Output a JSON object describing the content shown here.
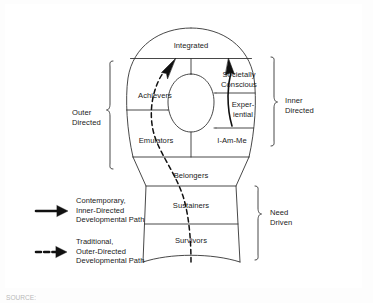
{
  "diagram": {
    "segments": [
      {
        "id": "integrated",
        "label": "Integrated"
      },
      {
        "id": "achievers",
        "label": "Achievers"
      },
      {
        "id": "societally-conscious",
        "label_line1": "Societally",
        "label_line2": "Conscious"
      },
      {
        "id": "experiential",
        "label_line1": "Exper-",
        "label_line2": "iential"
      },
      {
        "id": "emulators",
        "label": "Emulators"
      },
      {
        "id": "i-am-me",
        "label": "I-Am-Me"
      },
      {
        "id": "belongers",
        "label": "Belongers"
      },
      {
        "id": "sustainers",
        "label": "Sustainers"
      },
      {
        "id": "survivors",
        "label": "Survivors"
      }
    ],
    "groups": [
      {
        "id": "outer-directed",
        "line1": "Outer",
        "line2": "Directed",
        "side": "left"
      },
      {
        "id": "inner-directed",
        "line1": "Inner",
        "line2": "Directed",
        "side": "right"
      },
      {
        "id": "need-driven",
        "line1": "Need",
        "line2": "Driven",
        "side": "right"
      }
    ],
    "legend": [
      {
        "id": "contemporary-inner-directed",
        "style": "solid",
        "line1": "Contemporary,",
        "line2": "Inner-Directed",
        "line3": "Developmental Path"
      },
      {
        "id": "traditional-outer-directed",
        "style": "dashed",
        "line1": "Traditional,",
        "line2": "Outer-Directed",
        "line3": "Developmental Path"
      }
    ],
    "source_note": "SOURCE:",
    "colors": {
      "ink": "#1a1a1a",
      "line": "#333333",
      "frame": "#555555",
      "background": "#ffffff"
    }
  }
}
